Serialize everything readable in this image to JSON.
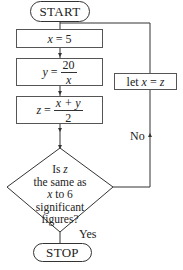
{
  "flowchart": {
    "start": {
      "label": "START"
    },
    "step1": {
      "var": "x",
      "op": "=",
      "value": "5"
    },
    "step2": {
      "var": "y",
      "op": "=",
      "numerator": "20",
      "denominator": "x"
    },
    "step3": {
      "var": "z",
      "op": "=",
      "numerator": "x + y",
      "denominator": "2"
    },
    "decision": {
      "line1_prefix": "Is ",
      "line1_var": "z",
      "line2": "the same as",
      "line3_var": "x",
      "line3_suffix": " to 6",
      "line4": "significant",
      "line5": "figures?"
    },
    "loop_step": {
      "prefix": "let ",
      "var1": "x",
      "op": " = ",
      "var2": "z"
    },
    "branch_no": "No",
    "branch_yes": "Yes",
    "stop": {
      "label": "STOP"
    }
  },
  "colors": {
    "line": "#333333",
    "background": "#ffffff",
    "text": "#222222"
  }
}
